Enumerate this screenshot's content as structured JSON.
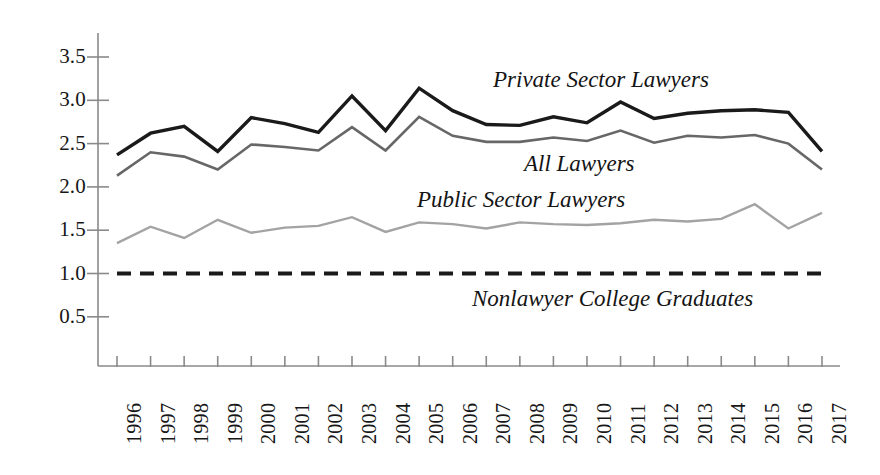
{
  "chart_data": {
    "type": "line",
    "title": "",
    "subtitle": "",
    "xlabel": "",
    "ylabel": "",
    "grid": false,
    "legend_position": "inline-annotations",
    "categories": [
      "1996",
      "1997",
      "1998",
      "1999",
      "2000",
      "2001",
      "2002",
      "2003",
      "2004",
      "2005",
      "2006",
      "2007",
      "2008",
      "2009",
      "2010",
      "2011",
      "2012",
      "2013",
      "2014",
      "2015",
      "2016",
      "2017"
    ],
    "x": [
      1996,
      1997,
      1998,
      1999,
      2000,
      2001,
      2002,
      2003,
      2004,
      2005,
      2006,
      2007,
      2008,
      2009,
      2010,
      2011,
      2012,
      2013,
      2014,
      2015,
      2016,
      2017
    ],
    "xlim": [
      1996,
      2017
    ],
    "ylim": [
      0,
      3.75
    ],
    "yticks": [
      "0.5",
      "1.0",
      "1.5",
      "2.0",
      "2.5",
      "3.0",
      "3.5"
    ],
    "ytick_values": [
      0.5,
      1.0,
      1.5,
      2.0,
      2.5,
      3.0,
      3.5
    ],
    "series": [
      {
        "name": "Private Sector Lawyers",
        "color": "#1a1a1a",
        "width": 3.4,
        "dash": "none",
        "values": [
          2.37,
          2.62,
          2.7,
          2.41,
          2.8,
          2.73,
          2.63,
          3.05,
          2.65,
          3.14,
          2.88,
          2.72,
          2.71,
          2.81,
          2.74,
          2.98,
          2.79,
          2.85,
          2.88,
          2.89,
          2.86,
          2.41
        ]
      },
      {
        "name": "All Lawyers",
        "color": "#676767",
        "width": 2.6,
        "dash": "none",
        "values": [
          2.13,
          2.4,
          2.35,
          2.2,
          2.49,
          2.46,
          2.42,
          2.69,
          2.42,
          2.81,
          2.59,
          2.52,
          2.52,
          2.57,
          2.53,
          2.65,
          2.51,
          2.59,
          2.57,
          2.6,
          2.5,
          2.2
        ]
      },
      {
        "name": "Public Sector Lawyers",
        "color": "#a3a3a3",
        "width": 2.4,
        "dash": "none",
        "values": [
          1.35,
          1.54,
          1.41,
          1.62,
          1.47,
          1.53,
          1.55,
          1.65,
          1.48,
          1.59,
          1.57,
          1.52,
          1.59,
          1.57,
          1.56,
          1.58,
          1.62,
          1.6,
          1.63,
          1.8,
          1.52,
          1.7
        ]
      },
      {
        "name": "Nonlawyer College Graduates",
        "color": "#1a1a1a",
        "width": 4.0,
        "dash": "14,9",
        "values": [
          1.0,
          1.0,
          1.0,
          1.0,
          1.0,
          1.0,
          1.0,
          1.0,
          1.0,
          1.0,
          1.0,
          1.0,
          1.0,
          1.0,
          1.0,
          1.0,
          1.0,
          1.0,
          1.0,
          1.0,
          1.0,
          1.0
        ]
      }
    ],
    "annotations": [
      {
        "text": "Private Sector Lawyers",
        "x": 2007,
        "y": 3.25
      },
      {
        "text": "All Lawyers",
        "x": 2008,
        "y": 2.28
      },
      {
        "text": "Public Sector Lawyers",
        "x": 2005,
        "y": 1.88
      },
      {
        "text": "Nonlawyer College Graduates",
        "x": 2007,
        "y": 0.73
      }
    ]
  },
  "axis": {
    "y_tick_labels": [
      "3.5",
      "3.0",
      "2.5",
      "2.0",
      "1.5",
      "1.0",
      "0.5"
    ],
    "x_tick_labels": [
      "1996",
      "1997",
      "1998",
      "1999",
      "2000",
      "2001",
      "2002",
      "2003",
      "2004",
      "2005",
      "2006",
      "2007",
      "2008",
      "2009",
      "2010",
      "2011",
      "2012",
      "2013",
      "2014",
      "2015",
      "2016",
      "2017"
    ],
    "axis_color": "#8a8a8a"
  },
  "labels": {
    "private_sector": "Private Sector Lawyers",
    "all_lawyers": "All Lawyers",
    "public_sector": "Public Sector Lawyers",
    "nonlawyer": "Nonlawyer College Graduates"
  }
}
